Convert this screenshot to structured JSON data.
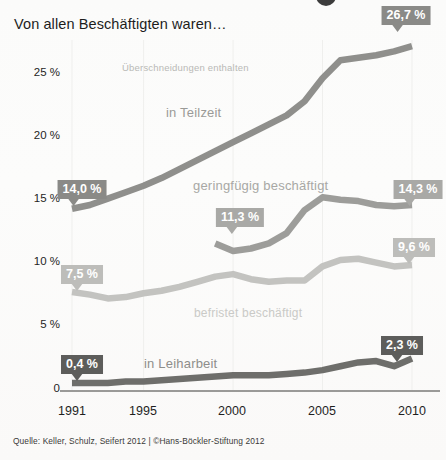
{
  "title": "Von allen Beschäftigten waren…",
  "overlap_note": "Überschneidungen enthalten",
  "source": "Quelle: Keller, Schulz, Seifert 2012 | ©Hans-Böckler-Stiftung 2012",
  "axis": {
    "y_ticks": [
      "25 %",
      "20 %",
      "15 %",
      "10 %",
      "5 %",
      "0"
    ],
    "x_ticks": [
      "1991",
      "1995",
      "2000",
      "2005",
      "2010"
    ]
  },
  "series_labels": {
    "teilzeit": "in Teilzeit",
    "geringfuegig": "geringfügig beschäftigt",
    "befristet": "befristet beschäftigt",
    "leiharbeit": "in Leiharbeit"
  },
  "callouts": [
    {
      "id": "teilzeit-end",
      "value": "26,7",
      "unit": "%"
    },
    {
      "id": "teilzeit-start",
      "value": "14,0",
      "unit": "%"
    },
    {
      "id": "gering-start",
      "value": "11,3",
      "unit": "%"
    },
    {
      "id": "gering-end",
      "value": "14,3",
      "unit": "%"
    },
    {
      "id": "befristet-start",
      "value": "7,5",
      "unit": "%"
    },
    {
      "id": "befristet-end",
      "value": "9,6",
      "unit": "%"
    },
    {
      "id": "leih-start",
      "value": "0,4",
      "unit": "%"
    },
    {
      "id": "leih-end",
      "value": "2,3",
      "unit": "%"
    }
  ],
  "colors": {
    "teilzeit": "#8f8f8c",
    "geringfuegig": "#9d9d9a",
    "befristet": "#c3c3c0",
    "leiharbeit": "#6e6e6b",
    "axis": "#3a3a38",
    "grid": "#efefed"
  },
  "chart_data": {
    "type": "line",
    "title": "Von allen Beschäftigten waren…",
    "subtitle": "Überschneidungen enthalten",
    "xlabel": "",
    "ylabel": "Anteil an allen Beschäftigten (%)",
    "xlim": [
      1991,
      2010
    ],
    "ylim": [
      0,
      27.5
    ],
    "yticks": [
      0,
      5,
      10,
      15,
      20,
      25
    ],
    "xticks": [
      1991,
      1995,
      2000,
      2005,
      2010
    ],
    "grid": false,
    "legend": "inline-labels",
    "x": [
      1991,
      1992,
      1993,
      1994,
      1995,
      1996,
      1997,
      1998,
      1999,
      2000,
      2001,
      2002,
      2003,
      2004,
      2005,
      2006,
      2007,
      2008,
      2009,
      2010
    ],
    "series": [
      {
        "name": "in Teilzeit",
        "color": "#8f8f8c",
        "start_label": "14,0 %",
        "end_label": "26,7 %",
        "values": [
          14.0,
          14.3,
          14.8,
          15.3,
          15.8,
          16.4,
          17.1,
          17.8,
          18.5,
          19.2,
          19.9,
          20.6,
          21.3,
          22.4,
          24.2,
          25.6,
          25.8,
          26.0,
          26.3,
          26.7
        ]
      },
      {
        "name": "geringfügig beschäftigt",
        "color": "#9d9d9a",
        "start_label": "11,3 %",
        "end_label": "14,3 %",
        "values": [
          null,
          null,
          null,
          null,
          null,
          null,
          null,
          null,
          11.3,
          10.7,
          10.9,
          11.3,
          12.1,
          13.9,
          14.9,
          14.7,
          14.6,
          14.3,
          14.2,
          14.3
        ]
      },
      {
        "name": "befristet beschäftigt",
        "color": "#c3c3c0",
        "start_label": "7,5 %",
        "end_label": "9,6 %",
        "values": [
          7.5,
          7.3,
          7.0,
          7.1,
          7.4,
          7.6,
          7.9,
          8.3,
          8.7,
          8.9,
          8.5,
          8.3,
          8.4,
          8.4,
          9.5,
          10.0,
          10.1,
          9.8,
          9.5,
          9.6
        ]
      },
      {
        "name": "in Leiharbeit",
        "color": "#6e6e6b",
        "start_label": "0,4 %",
        "end_label": "2,3 %",
        "values": [
          0.4,
          0.4,
          0.4,
          0.5,
          0.5,
          0.6,
          0.7,
          0.8,
          0.9,
          1.0,
          1.0,
          1.0,
          1.1,
          1.2,
          1.4,
          1.7,
          2.0,
          2.1,
          1.7,
          2.3
        ]
      }
    ]
  }
}
